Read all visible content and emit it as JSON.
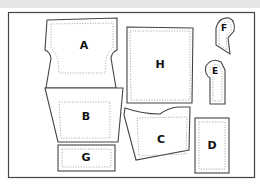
{
  "diagram": {
    "type": "sewing-pattern-layout",
    "colors": {
      "background": "#ffffff",
      "top_band": "#e6e6e6",
      "outline": "#444444",
      "seam_allowance": "#9a9a9a",
      "label": "#111111"
    },
    "pieces": [
      {
        "id": "A",
        "label": "A",
        "shape": "waisted-panel"
      },
      {
        "id": "B",
        "label": "B",
        "shape": "trapezoid"
      },
      {
        "id": "C",
        "label": "C",
        "shape": "pocket-panel"
      },
      {
        "id": "D",
        "label": "D",
        "shape": "rectangle"
      },
      {
        "id": "E",
        "label": "E",
        "shape": "rounded-strap"
      },
      {
        "id": "F",
        "label": "F",
        "shape": "rounded-tab"
      },
      {
        "id": "G",
        "label": "G",
        "shape": "rectangle"
      },
      {
        "id": "H",
        "label": "H",
        "shape": "square"
      }
    ]
  }
}
